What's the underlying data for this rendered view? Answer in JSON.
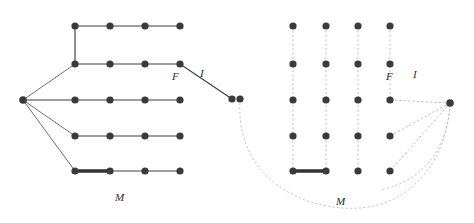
{
  "figure": {
    "title": "",
    "background_color": "#ffffff",
    "node_color": "#3a3a3a",
    "edge_color": "#3f3f3f",
    "bold_edge_color": "#333333",
    "dashed_edge_color": "#b6b6b6",
    "node_radius": 3.6,
    "width": 474,
    "height": 223
  },
  "left_panel": {
    "name": "left-graph",
    "hub": {
      "id": "L0",
      "x": 23,
      "y": 100
    },
    "rows": [
      {
        "row": 1,
        "y": 26,
        "nodes": [
          {
            "id": "L11",
            "x": 75
          },
          {
            "id": "L12",
            "x": 110
          },
          {
            "id": "L13",
            "x": 145
          },
          {
            "id": "L14",
            "x": 180
          }
        ]
      },
      {
        "row": 2,
        "y": 64,
        "nodes": [
          {
            "id": "L21",
            "x": 75
          },
          {
            "id": "L22",
            "x": 110
          },
          {
            "id": "L23",
            "x": 145
          },
          {
            "id": "L24",
            "x": 180
          }
        ]
      },
      {
        "row": 3,
        "y": 100,
        "nodes": [
          {
            "id": "L31",
            "x": 75
          },
          {
            "id": "L32",
            "x": 110
          },
          {
            "id": "L33",
            "x": 145
          },
          {
            "id": "L34",
            "x": 180
          }
        ]
      },
      {
        "row": 4,
        "y": 136,
        "nodes": [
          {
            "id": "L41",
            "x": 75
          },
          {
            "id": "L42",
            "x": 110
          },
          {
            "id": "L43",
            "x": 145
          },
          {
            "id": "L44",
            "x": 180
          }
        ]
      },
      {
        "row": 5,
        "y": 171,
        "nodes": [
          {
            "id": "L51",
            "x": 75
          },
          {
            "id": "L52",
            "x": 110
          },
          {
            "id": "L53",
            "x": 145
          },
          {
            "id": "L54",
            "x": 180
          }
        ]
      }
    ],
    "extra_nodes": [
      {
        "id": "LX1",
        "x": 232,
        "y": 99
      },
      {
        "id": "LX2",
        "x": 240,
        "y": 99
      }
    ],
    "bold_edge": {
      "from": "L51",
      "to": "L52",
      "x1": 75,
      "y1": 171,
      "x2": 110,
      "y2": 171
    },
    "diagonal_edge": {
      "from": "L24",
      "to": "LX1",
      "x1": 180,
      "y1": 64,
      "x2": 232,
      "y2": 99
    },
    "labels": [
      {
        "name": "label-F",
        "text": "F",
        "x": 175,
        "y": 78
      },
      {
        "name": "label-I",
        "text": "I",
        "x": 201,
        "y": 75
      },
      {
        "name": "label-M",
        "text": "M",
        "x": 118,
        "y": 200
      }
    ]
  },
  "right_panel": {
    "name": "right-graph",
    "hub": {
      "id": "R0",
      "x": 450,
      "y": 103
    },
    "columns_x": [
      293,
      326,
      358,
      390
    ],
    "rows_y": [
      26,
      64,
      100,
      136,
      171
    ],
    "labels": [
      {
        "name": "label-F",
        "text": "F",
        "x": 389,
        "y": 78
      },
      {
        "name": "label-I",
        "text": "I",
        "x": 414,
        "y": 76
      },
      {
        "name": "label-M",
        "text": "M",
        "x": 339,
        "y": 203
      }
    ],
    "bold_edge": {
      "x1": 293,
      "y1": 171,
      "x2": 326,
      "y2": 171
    }
  }
}
